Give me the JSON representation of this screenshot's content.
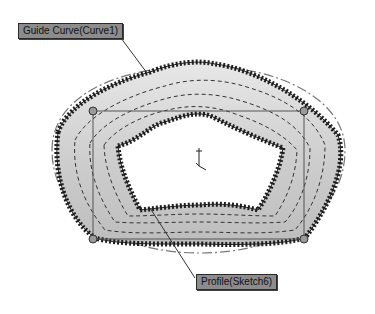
{
  "scene": {
    "type": "CAD sweep feature preview",
    "callouts": {
      "guide_curve": "Guide Curve(Curve1)",
      "profile": "Profile(Sketch6)"
    },
    "colors": {
      "background": "#ffffff",
      "surface_fill": "#d4d4d4",
      "hatch": "#1e1e1e",
      "construction_line": "#555555",
      "callout_bg": "#8c8c8c",
      "handle": "#9a9a9a"
    },
    "icons": {
      "origin": "coordinate-triad-icon",
      "handles": "sketch-point-handle-icon"
    }
  }
}
